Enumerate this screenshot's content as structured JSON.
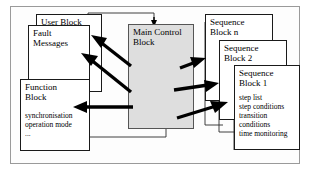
{
  "diagram": {
    "frame": {
      "name": "outer-frame"
    },
    "blocks": [
      {
        "id": "user_block",
        "label": "User Block",
        "detail": "",
        "fill": "#ffffff"
      },
      {
        "id": "fault_messages",
        "label": "Fault\nMessages",
        "detail": "",
        "fill": "#ffffff"
      },
      {
        "id": "function_block",
        "label": "Function\nBlock",
        "detail": "synchronisation\noperation mode\n...",
        "fill": "#ffffff"
      },
      {
        "id": "main_control_block",
        "label": "Main Control\nBlock",
        "detail": "",
        "fill": "#dedede"
      },
      {
        "id": "sequence_block_n",
        "label": "Sequence\nBlock n",
        "detail": "",
        "fill": "#ffffff"
      },
      {
        "id": "sequence_block_2",
        "label": "Sequence\nBlock 2",
        "detail": "",
        "fill": "#ffffff"
      },
      {
        "id": "sequence_block_1",
        "label": "Sequence\nBlock 1",
        "detail": "step list\nstep conditions\ntransition\n  conditions\ntime monitoring",
        "fill": "#ffffff"
      }
    ],
    "connectors": {
      "thick_arrow_color": "#000000",
      "thin_line_color": "#2a2a2a",
      "arrows": [
        {
          "name": "mcb-to-fault-messages",
          "from": "main_control_block",
          "to": "fault_messages"
        },
        {
          "name": "mcb-to-user-block",
          "from": "main_control_block",
          "to": "user_block"
        },
        {
          "name": "mcb-to-function-block",
          "from": "main_control_block",
          "to": "function_block"
        },
        {
          "name": "mcb-to-sequence-block-n",
          "from": "main_control_block",
          "to": "sequence_block_n"
        },
        {
          "name": "mcb-to-sequence-block-2",
          "from": "main_control_block",
          "to": "sequence_block_2"
        },
        {
          "name": "mcb-to-sequence-block-1",
          "from": "main_control_block",
          "to": "sequence_block_1"
        },
        {
          "name": "feedback-into-mcb-top",
          "from": "blocks",
          "to": "main_control_block"
        }
      ]
    }
  }
}
